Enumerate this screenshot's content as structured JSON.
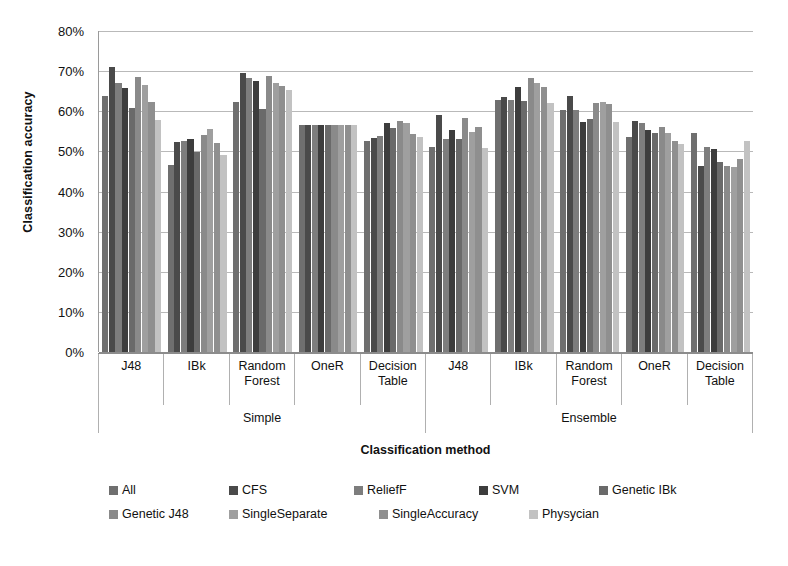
{
  "chart_data": {
    "type": "bar",
    "title": "",
    "xlabel": "Classification method",
    "ylabel": "Classification accuracy",
    "ylim": [
      0,
      0.8
    ],
    "ytick_labels": [
      "0%",
      "10%",
      "20%",
      "30%",
      "40%",
      "50%",
      "60%",
      "70%",
      "80%"
    ],
    "ytick_values": [
      0,
      10,
      20,
      30,
      40,
      50,
      60,
      70,
      80
    ],
    "grid": true,
    "legend_position": "bottom",
    "super_categories": [
      "Simple",
      "Ensemble"
    ],
    "categories": [
      "J48",
      "IBk",
      "Random Forest",
      "OneR",
      "Decision Table",
      "J48",
      "IBk",
      "Random Forest",
      "OneR",
      "Decision Table"
    ],
    "category_lines": [
      [
        "J48"
      ],
      [
        "IBk"
      ],
      [
        "Random",
        "Forest"
      ],
      [
        "OneR"
      ],
      [
        "Decision",
        "Table"
      ],
      [
        "J48"
      ],
      [
        "IBk"
      ],
      [
        "Random",
        "Forest"
      ],
      [
        "OneR"
      ],
      [
        "Decision",
        "Table"
      ]
    ],
    "series": [
      {
        "name": "All",
        "color": "#6f6f6f",
        "values": [
          63.8,
          46.5,
          62.2,
          56.5,
          52.6,
          51.0,
          62.8,
          60.3,
          53.5,
          54.6
        ]
      },
      {
        "name": "CFS",
        "color": "#4a4a4a",
        "values": [
          71.0,
          52.4,
          69.5,
          56.5,
          53.3,
          59.0,
          63.6,
          63.9,
          57.6,
          46.4
        ]
      },
      {
        "name": "ReliefF",
        "color": "#7d7d7d",
        "values": [
          67.0,
          52.6,
          68.4,
          56.5,
          53.8,
          53.0,
          62.8,
          60.2,
          57.2,
          51.0
        ]
      },
      {
        "name": "SVM",
        "color": "#3d3d3d",
        "values": [
          65.8,
          53.1,
          67.6,
          56.5,
          57.2,
          55.4,
          66.0,
          57.3,
          55.3,
          50.5
        ]
      },
      {
        "name": "Genetic IBk",
        "color": "#6a6a6a",
        "values": [
          60.8,
          49.9,
          60.5,
          56.5,
          55.9,
          53.1,
          62.5,
          58.0,
          54.7,
          47.4
        ]
      },
      {
        "name": "Genetic J48",
        "color": "#8a8a8a",
        "values": [
          68.6,
          54.0,
          68.8,
          56.5,
          57.6,
          58.2,
          68.2,
          62.0,
          56.2,
          46.3
        ]
      },
      {
        "name": "SingleSeparate",
        "color": "#9f9f9f",
        "values": [
          66.5,
          55.6,
          67.1,
          56.5,
          57.0,
          54.8,
          67.0,
          62.4,
          54.5,
          46.2
        ]
      },
      {
        "name": "SingleAccuracy",
        "color": "#8f8f8f",
        "values": [
          62.2,
          52.1,
          66.2,
          56.5,
          54.3,
          56.2,
          66.0,
          61.8,
          52.6,
          48.0
        ]
      },
      {
        "name": "Physycian",
        "color": "#c2c2c2",
        "values": [
          57.8,
          49.0,
          65.4,
          56.5,
          53.7,
          50.8,
          62.0,
          57.4,
          51.8,
          52.7
        ]
      }
    ]
  },
  "axis": {
    "y_title": "Classification accuracy",
    "x_title": "Classification method"
  }
}
